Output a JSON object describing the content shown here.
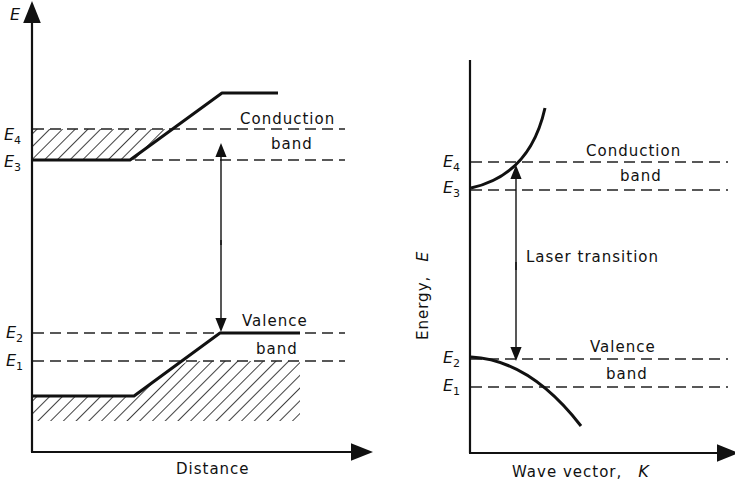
{
  "left_diagram": {
    "y_axis_label": "E",
    "x_axis_label": "Distance",
    "levels": [
      {
        "name": "E",
        "sub": "4"
      },
      {
        "name": "E",
        "sub": "3"
      },
      {
        "name": "E",
        "sub": "2"
      },
      {
        "name": "E",
        "sub": "1"
      }
    ],
    "conduction_label_1": "Conduction",
    "conduction_label_2": "band",
    "valence_label_1": "Valence",
    "valence_label_2": "band"
  },
  "right_diagram": {
    "y_axis_label": "Energy,",
    "y_axis_symbol": "E",
    "x_axis_label": "Wave vector,",
    "x_axis_symbol": "K",
    "levels": [
      {
        "name": "E",
        "sub": "4"
      },
      {
        "name": "E",
        "sub": "3"
      },
      {
        "name": "E",
        "sub": "2"
      },
      {
        "name": "E",
        "sub": "1"
      }
    ],
    "conduction_label_1": "Conduction",
    "conduction_label_2": "band",
    "valence_label_1": "Valence",
    "valence_label_2": "band",
    "transition_label": "Laser transition"
  }
}
